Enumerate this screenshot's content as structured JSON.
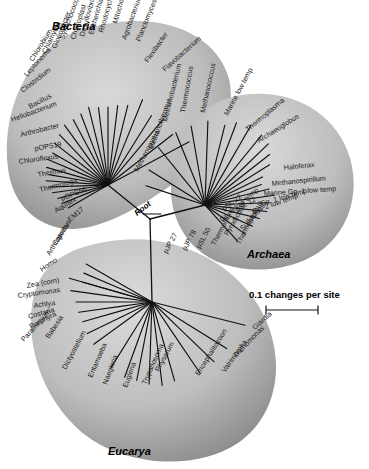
{
  "figure": {
    "type": "unrooted-phylogenetic-tree",
    "root_label": "Root",
    "scale_bar": {
      "label": "0.1 changes per site",
      "value": 0.1,
      "units": "changes per site"
    },
    "domain_labels": [
      "Bacteria",
      "Archaea",
      "Eucarya"
    ]
  },
  "domains": [
    {
      "name": "Bacteria",
      "label": "Bacteria",
      "fan_center": {
        "x": 108,
        "y": 185
      },
      "blob_color": "#b9b9b9",
      "taxa": [
        {
          "name": "Flavobacterium",
          "angle": -28,
          "len": 92,
          "lx": 165,
          "ly": 72,
          "rot": -42
        },
        {
          "name": "Flexibacter",
          "angle": -38,
          "len": 82,
          "lx": 148,
          "ly": 63,
          "rot": -55
        },
        {
          "name": "Planctomyces",
          "angle": -50,
          "len": 86,
          "lx": 140,
          "ly": 42,
          "rot": -68
        },
        {
          "name": "Agrobacterium",
          "angle": -58,
          "len": 82,
          "lx": 126,
          "ly": 40,
          "rot": -70
        },
        {
          "name": "Mitochondrion",
          "angle": -68,
          "len": 92,
          "lx": 117,
          "ly": 24,
          "rot": -74
        },
        {
          "name": "Rhodocyclus",
          "angle": -76,
          "len": 82,
          "lx": 103,
          "ly": 33,
          "rot": -74
        },
        {
          "name": "Escherichia",
          "angle": -83,
          "len": 80,
          "lx": 93,
          "ly": 35,
          "rot": -74
        },
        {
          "name": "Desulfovibrio",
          "angle": -90,
          "len": 78,
          "lx": 84,
          "ly": 37,
          "rot": -74
        },
        {
          "name": "Chloroplast",
          "angle": -97,
          "len": 78,
          "lx": 75,
          "ly": 40,
          "rot": -72
        },
        {
          "name": "Synechococcus",
          "angle": -104,
          "len": 80,
          "lx": 64,
          "ly": 40,
          "rot": -70
        },
        {
          "name": "Gloeobacter",
          "angle": -111,
          "len": 76,
          "lx": 56,
          "ly": 49,
          "rot": -68
        },
        {
          "name": "Chlamydia",
          "angle": -118,
          "len": 74,
          "lx": 46,
          "ly": 54,
          "rot": -64
        },
        {
          "name": "Chlorobium",
          "angle": -126,
          "len": 74,
          "lx": 33,
          "ly": 62,
          "rot": -58
        },
        {
          "name": "Leptonema",
          "angle": -134,
          "len": 70,
          "lx": 27,
          "ly": 77,
          "rot": -48
        },
        {
          "name": "Clostridium",
          "angle": -142,
          "len": 68,
          "lx": 23,
          "ly": 93,
          "rot": -38
        },
        {
          "name": "Bacillus",
          "angle": -150,
          "len": 64,
          "lx": 30,
          "ly": 109,
          "rot": -28
        },
        {
          "name": "Heliobacterium",
          "angle": -157,
          "len": 66,
          "lx": 12,
          "ly": 122,
          "rot": -20
        },
        {
          "name": "Arthrobacter",
          "angle": -164,
          "len": 64,
          "lx": 21,
          "ly": 137,
          "rot": -14
        },
        {
          "name": "pOPS19",
          "angle": -170,
          "len": 60,
          "lx": 35,
          "ly": 151,
          "rot": -10
        },
        {
          "name": "Chloroflexus",
          "angle": -176,
          "len": 62,
          "lx": 19,
          "ly": 164,
          "rot": -8
        },
        {
          "name": "Thermus",
          "angle": 178,
          "len": 58,
          "lx": 38,
          "ly": 177,
          "rot": -10
        },
        {
          "name": "Thermotoga",
          "angle": 172,
          "len": 56,
          "lx": 40,
          "ly": 192,
          "rot": -14
        },
        {
          "name": "pOPS66",
          "angle": 165,
          "len": 52,
          "lx": 62,
          "ly": 201,
          "rot": -22
        },
        {
          "name": "Aquifex",
          "angle": 158,
          "len": 50,
          "lx": 56,
          "ly": 213,
          "rot": -30
        },
        {
          "name": "EM17",
          "angle": 150,
          "len": 46,
          "lx": 70,
          "ly": 222,
          "rot": -40
        }
      ]
    },
    {
      "name": "Archaea",
      "label": "Archaea",
      "fan_center": {
        "x": 205,
        "y": 205
      },
      "blob_color": "#b9b9b9",
      "taxa": [
        {
          "name": "Methanopyrus",
          "angle": 198,
          "len": 62,
          "lx": 138,
          "ly": 172,
          "rot": -62
        },
        {
          "name": "Methanothermus",
          "angle": 212,
          "len": 66,
          "lx": 153,
          "ly": 150,
          "rot": -70
        },
        {
          "name": "Methanobacterium",
          "angle": 231,
          "len": 74,
          "lx": 167,
          "ly": 122,
          "rot": -76
        },
        {
          "name": "Thermococcus",
          "angle": 248,
          "len": 78,
          "lx": 185,
          "ly": 113,
          "rot": -80
        },
        {
          "name": "Methanococcus",
          "angle": 260,
          "len": 80,
          "lx": 205,
          "ly": 113,
          "rot": -78
        },
        {
          "name": "Marine low temp",
          "angle": 272,
          "len": 84,
          "lx": 228,
          "ly": 116,
          "rot": -62
        },
        {
          "name": "Thermoplasma",
          "angle": 284,
          "len": 82,
          "lx": 248,
          "ly": 132,
          "rot": -40
        },
        {
          "name": "Archaeoglobus",
          "angle": 291,
          "len": 88,
          "lx": 259,
          "ly": 143,
          "rot": -32
        },
        {
          "name": "Haloferax",
          "angle": 300,
          "len": 92,
          "lx": 284,
          "ly": 170,
          "rot": -6
        },
        {
          "name": "Methanospirillum",
          "angle": 309,
          "len": 90,
          "lx": 272,
          "ly": 186,
          "rot": -6
        },
        {
          "name": "Marine Gp. 1 low temp",
          "angle": 316,
          "len": 88,
          "lx": 264,
          "ly": 196,
          "rot": -4
        },
        {
          "name": "Gp. 1 low temp",
          "angle": 322,
          "len": 82,
          "lx": 261,
          "ly": 206,
          "rot": -16
        },
        {
          "name": "Gp. 2 low temp",
          "angle": 328,
          "len": 76,
          "lx": 253,
          "ly": 214,
          "rot": -20
        },
        {
          "name": "pSL 12",
          "angle": 334,
          "len": 64,
          "lx": 237,
          "ly": 212,
          "rot": -30
        },
        {
          "name": "pSL 22",
          "angle": 340,
          "len": 60,
          "lx": 224,
          "ly": 211,
          "rot": -36
        },
        {
          "name": "Gp. 3 low temp",
          "angle": 346,
          "len": 66,
          "lx": 222,
          "ly": 222,
          "rot": -40
        },
        {
          "name": "Sulfolobus",
          "angle": 352,
          "len": 70,
          "lx": 243,
          "ly": 231,
          "rot": -48
        },
        {
          "name": "Pyrodictium",
          "angle": 358,
          "len": 64,
          "lx": 228,
          "ly": 236,
          "rot": -60
        },
        {
          "name": "Thermoproteus",
          "angle": 6,
          "len": 62,
          "lx": 240,
          "ly": 245,
          "rot": -62
        },
        {
          "name": "Thermofilum",
          "angle": 14,
          "len": 56,
          "lx": 215,
          "ly": 246,
          "rot": -62
        },
        {
          "name": "pSL 50",
          "angle": 24,
          "len": 52,
          "lx": 200,
          "ly": 249,
          "rot": -62
        },
        {
          "name": "pJP 78",
          "angle": 36,
          "len": 50,
          "lx": 186,
          "ly": 251,
          "rot": -62
        },
        {
          "name": "pJP 27",
          "angle": 48,
          "len": 48,
          "lx": 167,
          "ly": 254,
          "rot": -62
        }
      ]
    },
    {
      "name": "Eucarya",
      "label": "Eucarya",
      "fan_center": {
        "x": 152,
        "y": 302
      },
      "blob_color": "#b9b9b9",
      "taxa": [
        {
          "name": "Coprinus",
          "angle": 196,
          "len": 72,
          "lx": 56,
          "ly": 246,
          "rot": -58
        },
        {
          "name": "Arthropoda",
          "angle": 203,
          "len": 74,
          "lx": 50,
          "ly": 256,
          "rot": -58
        },
        {
          "name": "Homo",
          "angle": 210,
          "len": 76,
          "lx": 42,
          "ly": 272,
          "rot": -34
        },
        {
          "name": "Zea (corn)",
          "angle": 196,
          "len": 86,
          "lx": 27,
          "ly": 288,
          "rot": -10
        },
        {
          "name": "Cryptomonas",
          "angle": 188,
          "len": 82,
          "lx": 18,
          "ly": 298,
          "rot": -8
        },
        {
          "name": "Achlya",
          "angle": 180,
          "len": 76,
          "lx": 34,
          "ly": 308,
          "rot": -8
        },
        {
          "name": "Costaria",
          "angle": 172,
          "len": 74,
          "lx": 29,
          "ly": 319,
          "rot": -16
        },
        {
          "name": "Porphyra",
          "angle": 164,
          "len": 72,
          "lx": 31,
          "ly": 329,
          "rot": -28
        },
        {
          "name": "Paramecium",
          "angle": 154,
          "len": 72,
          "lx": 24,
          "ly": 342,
          "rot": -48
        },
        {
          "name": "Babesia",
          "angle": 144,
          "len": 72,
          "lx": 49,
          "ly": 339,
          "rot": -56
        },
        {
          "name": "Dictyostelium",
          "angle": 122,
          "len": 78,
          "lx": 66,
          "ly": 370,
          "rot": -62
        },
        {
          "name": "Entamoeba",
          "angle": 110,
          "len": 80,
          "lx": 92,
          "ly": 378,
          "rot": -66
        },
        {
          "name": "Naegleria",
          "angle": 101,
          "len": 80,
          "lx": 107,
          "ly": 385,
          "rot": -70
        },
        {
          "name": "Euglena",
          "angle": 92,
          "len": 82,
          "lx": 127,
          "ly": 388,
          "rot": -70
        },
        {
          "name": "Trypanosoma",
          "angle": 83,
          "len": 84,
          "lx": 146,
          "ly": 385,
          "rot": -66
        },
        {
          "name": "Physarum",
          "angle": 74,
          "len": 82,
          "lx": 159,
          "ly": 372,
          "rot": -62
        },
        {
          "name": "Encephalitozoon",
          "angle": 56,
          "len": 86,
          "lx": 199,
          "ly": 376,
          "rot": -58
        },
        {
          "name": "Vairimorpha",
          "angle": 44,
          "len": 86,
          "lx": 225,
          "ly": 373,
          "rot": -54
        },
        {
          "name": "Trichomonas",
          "angle": 32,
          "len": 88,
          "lx": 236,
          "ly": 358,
          "rot": -46
        },
        {
          "name": "Giardia",
          "angle": 14,
          "len": 96,
          "lx": 255,
          "ly": 330,
          "rot": -42
        }
      ]
    }
  ]
}
